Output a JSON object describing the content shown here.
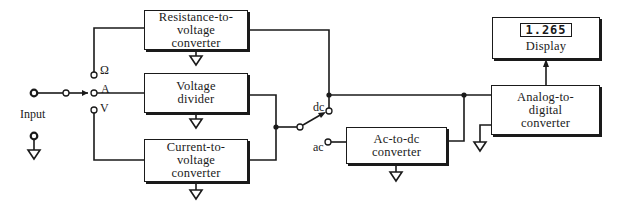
{
  "diagram": {
    "input": {
      "label": "Input"
    },
    "function_switch": {
      "positions": [
        {
          "symbol": "Ω",
          "meaning": "resistance"
        },
        {
          "symbol": "A",
          "meaning": "current"
        },
        {
          "symbol": "V",
          "meaning": "voltage"
        }
      ]
    },
    "coupling_switch": {
      "positions": [
        {
          "symbol": "dc"
        },
        {
          "symbol": "ac"
        }
      ]
    },
    "blocks": {
      "resistance": {
        "line1": "Resistance-to-",
        "line2": "voltage",
        "line3": "converter"
      },
      "divider": {
        "line1": "Voltage",
        "line2": "divider"
      },
      "current": {
        "line1": "Current-to-",
        "line2": "voltage",
        "line3": "converter"
      },
      "acdc": {
        "line1": "Ac-to-dc",
        "line2": "converter"
      },
      "adc": {
        "line1": "Analog-to-",
        "line2": "digital",
        "line3": "converter"
      },
      "display": {
        "reading": "1.265",
        "label": "Display"
      }
    },
    "colors": {
      "ink": "#1a1a1a",
      "background": "#ffffff"
    }
  }
}
